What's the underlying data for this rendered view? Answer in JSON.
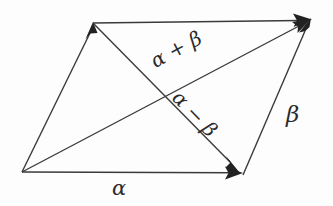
{
  "figure": {
    "background_color": "#fdfdfd",
    "stroke_color": "#3a3a3a",
    "labels": {
      "alpha": "α",
      "beta": "β",
      "sum": "α + β",
      "difference": "α − β"
    },
    "vertices": {
      "bottom_left": [
        22,
        172
      ],
      "top_left": [
        93,
        23
      ],
      "top_right": [
        310,
        20
      ],
      "bottom_right": [
        241,
        173
      ]
    },
    "edges": [
      {
        "name": "alpha-bottom-edge",
        "from": [
          22,
          172
        ],
        "to": [
          241,
          173
        ],
        "arrow": "end",
        "label": "α"
      },
      {
        "name": "alpha-top-edge",
        "from": [
          93,
          23
        ],
        "to": [
          310,
          20
        ],
        "arrow": "end",
        "label": ""
      },
      {
        "name": "beta-left-edge",
        "from": [
          22,
          172
        ],
        "to": [
          93,
          23
        ],
        "arrow": "end",
        "label": ""
      },
      {
        "name": "beta-right-edge",
        "from": [
          243,
          175
        ],
        "to": [
          310,
          20
        ],
        "arrow": "end",
        "label": "β"
      }
    ],
    "diagonals": [
      {
        "name": "sum-diagonal",
        "from": [
          22,
          172
        ],
        "to": [
          310,
          20
        ],
        "arrow": "end",
        "label": "α + β"
      },
      {
        "name": "difference-diagonal",
        "from": [
          93,
          23
        ],
        "to": [
          239,
          172
        ],
        "arrow": "end",
        "label": "α − β"
      }
    ],
    "intersection": [
      168,
      98
    ]
  }
}
